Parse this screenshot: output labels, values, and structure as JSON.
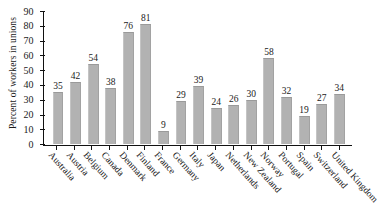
{
  "chart_data": {
    "type": "bar",
    "title": "",
    "xlabel": "",
    "ylabel": "Percent of workers in unions",
    "ylim": [
      0,
      90
    ],
    "yticks": [
      0,
      10,
      20,
      30,
      40,
      50,
      60,
      70,
      80,
      90
    ],
    "grid": false,
    "legend": "none",
    "bar_color": "#b2b2b2",
    "categories": [
      "Australia",
      "Austria",
      "Belgium",
      "Canada",
      "Denmark",
      "Finland",
      "France",
      "Germany",
      "Italy",
      "Japan",
      "Netherlands",
      "New Zealand",
      "Norway",
      "Portugal",
      "Spain",
      "Switzerland",
      "United Kingdom"
    ],
    "values": [
      35,
      42,
      54,
      38,
      76,
      81,
      9,
      29,
      39,
      24,
      26,
      30,
      58,
      32,
      19,
      27,
      34
    ]
  }
}
